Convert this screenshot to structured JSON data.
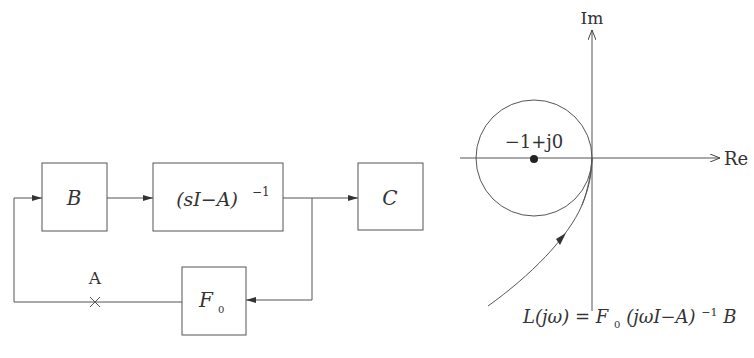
{
  "block_diagram": {
    "blocks": {
      "b": {
        "label": "B"
      },
      "resolvent": {
        "label_main": "(sI−A)",
        "label_exp": "−1"
      },
      "c": {
        "label": "C"
      },
      "f0": {
        "label_main": "F",
        "label_sub": "0"
      }
    },
    "break_point": {
      "label": "A",
      "marker": "×"
    }
  },
  "nyquist_plot": {
    "axes": {
      "imag_label": "Im",
      "real_label": "Re"
    },
    "critical_point": {
      "label": "−1+j0"
    },
    "curve_label": {
      "lhs": "L(jω) = F",
      "sub": "0",
      "mid": "(jωI−A)",
      "exp": "−1",
      "tail": "B"
    }
  },
  "colors": {
    "stroke": "#555555",
    "text": "#333333",
    "background": "#ffffff"
  }
}
